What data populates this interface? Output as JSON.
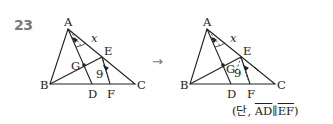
{
  "problem_number": "23",
  "arrow": "→",
  "left_figure": {
    "labels": {
      "A": "A",
      "B": "B",
      "C": "C",
      "D": "D",
      "E": "E",
      "F": "F",
      "G": "G"
    },
    "angle_label": "x",
    "length_label": "9"
  },
  "right_figure": {
    "labels": {
      "A": "A",
      "B": "B",
      "C": "C",
      "D": "D",
      "E": "E",
      "F": "F",
      "G": "G"
    },
    "angle_label": "x",
    "length_label": "9"
  },
  "note": {
    "prefix": "(단, ",
    "seg1": "AD",
    "parallel": "∥",
    "seg2": "EF",
    "suffix": ")"
  },
  "colors": {
    "line": "#222222",
    "number": "#7a7a7a"
  }
}
